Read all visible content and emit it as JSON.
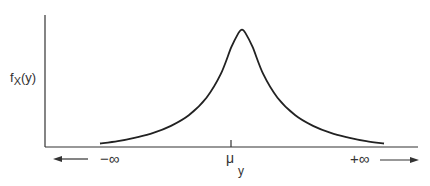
{
  "chart_data": {
    "type": "line",
    "title": "",
    "ylabel": "f_X(y)",
    "ylabel_main": "f",
    "ylabel_sub": "X",
    "ylabel_paren": "(y)",
    "xlabel": "",
    "x_tick_labels": {
      "left": "−∞",
      "center_main": "μ",
      "center_sub": "y",
      "right": "+∞"
    },
    "x_arrows": [
      "left",
      "right"
    ],
    "curve": {
      "description": "symmetric bell-shaped probability density centered at mean",
      "shape": "sharp-peaked (Laplace-like) density",
      "center": 0,
      "x_range": [
        -4,
        4
      ],
      "points": [
        [
          -4.0,
          0.03
        ],
        [
          -3.5,
          0.05
        ],
        [
          -3.0,
          0.08
        ],
        [
          -2.5,
          0.12
        ],
        [
          -2.0,
          0.18
        ],
        [
          -1.5,
          0.27
        ],
        [
          -1.0,
          0.42
        ],
        [
          -0.6,
          0.62
        ],
        [
          -0.3,
          0.85
        ],
        [
          -0.1,
          0.97
        ],
        [
          0.0,
          1.0
        ],
        [
          0.1,
          0.97
        ],
        [
          0.3,
          0.85
        ],
        [
          0.6,
          0.62
        ],
        [
          1.0,
          0.42
        ],
        [
          1.5,
          0.27
        ],
        [
          2.0,
          0.18
        ],
        [
          2.5,
          0.12
        ],
        [
          3.0,
          0.08
        ],
        [
          3.5,
          0.05
        ],
        [
          4.0,
          0.03
        ]
      ]
    },
    "ylim": [
      0,
      1.15
    ],
    "grid": false,
    "legend": "none"
  }
}
